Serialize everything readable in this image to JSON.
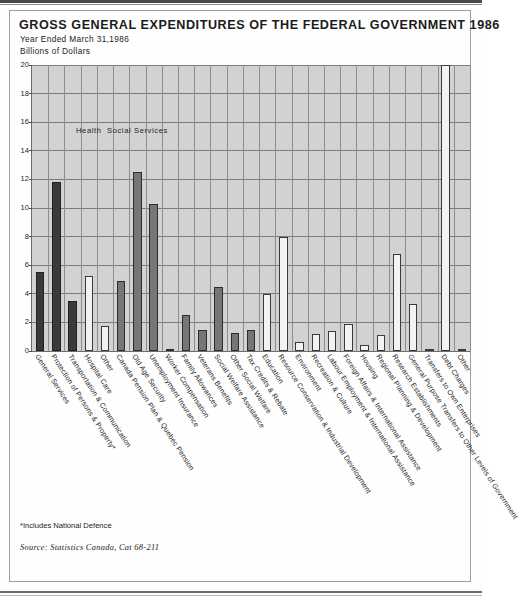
{
  "title": "GROSS GENERAL EXPENDITURES OF THE FEDERAL GOVERNMENT 1986",
  "subtitle": "Year Ended March 31,1986",
  "units": "Billions of Dollars",
  "footnote": "*Includes National Defence",
  "source": "Source: Statistics Canada, Cat 68-211",
  "colors": {
    "plot_background": "#d2d2d2",
    "grid": "#7b7b7b",
    "bar_dark": "#3a3a3a",
    "bar_mid": "#767676",
    "bar_light": "#f2f2f2",
    "axis": "#6d6d6d",
    "text": "#1c1c1c"
  },
  "chart_data": {
    "type": "bar",
    "title": "GROSS GENERAL EXPENDITURES OF THE FEDERAL GOVERNMENT 1986",
    "subtitle": "Year Ended March 31,1986",
    "xlabel": "",
    "ylabel": "Billions of Dollars",
    "ylim": [
      0,
      20
    ],
    "yticks": [
      0,
      2,
      4,
      6,
      8,
      10,
      12,
      14,
      16,
      18,
      20
    ],
    "ytick_labels": [
      "0",
      "2",
      "4",
      "6",
      "8",
      "10",
      "12",
      "14",
      "16",
      "18",
      "20"
    ],
    "grid": true,
    "legend": "none",
    "group_annotations": [
      {
        "label": "Health",
        "at_category": "Hospital Care",
        "value_y": 15.4
      },
      {
        "label": "Social Services",
        "at_category": "Old Age Security",
        "value_y": 15.4
      }
    ],
    "categories": [
      "General Services",
      "Protection of Persons & Property*",
      "Transportation & Communication",
      "Hospital Care",
      "Other",
      "Canada Pension Plan & Quebec Pension",
      "Old Age Security",
      "Unemployment Insurance",
      "Worker Compensation",
      "Family Allowances",
      "Veterans Benefits",
      "Social Welfare Assistance",
      "Other Social Welfare",
      "Tax Credits & Rebate",
      "Education",
      "Resource Conservation & Industrial Development",
      "Environment",
      "Recreation & Culture",
      "Labour Employment & International Assistance",
      "Foreign Affairs & International Assistance",
      "Housing",
      "Regional Planning & Development",
      "Research Establishments",
      "General Purpose Transfers to Other Levels of Government",
      "Transfers to Own Enterprises",
      "Debt Charges",
      "Other"
    ],
    "values": [
      5.5,
      11.8,
      3.5,
      5.25,
      1.75,
      4.9,
      12.5,
      10.25,
      0.15,
      2.5,
      1.5,
      4.5,
      1.25,
      1.5,
      4.0,
      8.0,
      0.6,
      1.2,
      1.4,
      1.9,
      0.4,
      1.1,
      6.8,
      3.3,
      0.15,
      20.0,
      0.1
    ],
    "bar_shades": [
      "dark",
      "dark",
      "dark",
      "light",
      "light",
      "mid",
      "mid",
      "mid",
      "mid",
      "mid",
      "mid",
      "mid",
      "mid",
      "mid",
      "light",
      "light",
      "light",
      "light",
      "light",
      "light",
      "light",
      "light",
      "light",
      "light",
      "light",
      "light",
      "light"
    ]
  }
}
